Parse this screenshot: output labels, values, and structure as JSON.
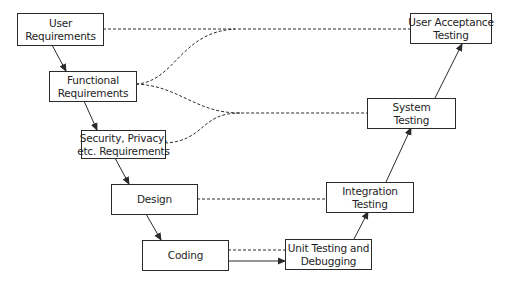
{
  "diagram": {
    "type": "v-model",
    "colors": {
      "stroke": "#2a2a2a",
      "text": "#1e1e1e",
      "background": "#ffffff"
    },
    "left_branch": [
      {
        "id": "user-requirements",
        "lines": [
          "User",
          "Requirements"
        ]
      },
      {
        "id": "functional-requirements",
        "lines": [
          "Functional",
          "Requirements"
        ]
      },
      {
        "id": "security-requirements",
        "lines": [
          "Security, Privacy,",
          "etc. Requirements"
        ]
      },
      {
        "id": "design",
        "lines": [
          "Design"
        ]
      },
      {
        "id": "coding",
        "lines": [
          "Coding"
        ]
      }
    ],
    "right_branch": [
      {
        "id": "unit-testing",
        "lines": [
          "Unit Testing and",
          "Debugging"
        ]
      },
      {
        "id": "integration-testing",
        "lines": [
          "Integration",
          "Testing"
        ]
      },
      {
        "id": "system-testing",
        "lines": [
          "System",
          "Testing"
        ]
      },
      {
        "id": "user-acceptance-testing",
        "lines": [
          "User Acceptance",
          "Testing"
        ]
      }
    ],
    "edges": [
      {
        "from": "user-requirements",
        "to": "functional-requirements",
        "style": "solid-arrow"
      },
      {
        "from": "functional-requirements",
        "to": "security-requirements",
        "style": "solid-arrow"
      },
      {
        "from": "security-requirements",
        "to": "design",
        "style": "solid-arrow"
      },
      {
        "from": "design",
        "to": "coding",
        "style": "solid-arrow"
      },
      {
        "from": "coding",
        "to": "unit-testing",
        "style": "solid-arrow"
      },
      {
        "from": "unit-testing",
        "to": "integration-testing",
        "style": "solid-arrow"
      },
      {
        "from": "integration-testing",
        "to": "system-testing",
        "style": "solid-arrow"
      },
      {
        "from": "system-testing",
        "to": "user-acceptance-testing",
        "style": "solid-arrow"
      },
      {
        "from": "user-requirements",
        "to": "user-acceptance-testing",
        "style": "dashed"
      },
      {
        "from": "functional-requirements",
        "to": "user-acceptance-testing",
        "style": "dashed"
      },
      {
        "from": "functional-requirements",
        "to": "system-testing",
        "style": "dashed"
      },
      {
        "from": "security-requirements",
        "to": "system-testing",
        "style": "dashed"
      },
      {
        "from": "design",
        "to": "integration-testing",
        "style": "dashed"
      },
      {
        "from": "coding",
        "to": "unit-testing",
        "style": "dashed"
      }
    ]
  }
}
